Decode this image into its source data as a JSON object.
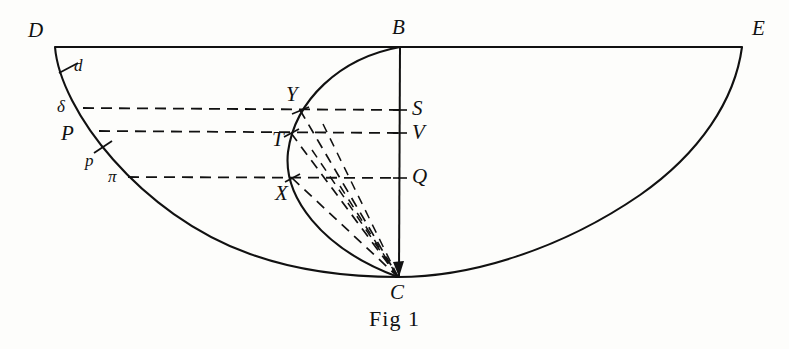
{
  "figure": {
    "caption": "Fig 1",
    "background_color": "#fdfdfb",
    "ink_color": "#111111",
    "labels": {
      "D": "D",
      "d": "d",
      "delta": "δ",
      "P": "P",
      "p": "p",
      "pi": "π",
      "B": "B",
      "Y": "Y",
      "T": "T",
      "X": "X",
      "S": "S",
      "V": "V",
      "Q": "Q",
      "C": "C",
      "E": "E"
    },
    "points": [
      {
        "name": "D",
        "label": "D",
        "x": 55,
        "y": 47,
        "label_x": 28,
        "label_y": 20,
        "style": "cap"
      },
      {
        "name": "d",
        "label": "d",
        "x": 68,
        "y": 68,
        "label_x": 74,
        "label_y": 57,
        "style": "small"
      },
      {
        "name": "delta",
        "label": "δ",
        "x": 82,
        "y": 108,
        "label_x": 57,
        "label_y": 98,
        "style": "greek"
      },
      {
        "name": "P",
        "label": "P",
        "x": 97,
        "y": 133,
        "label_x": 61,
        "label_y": 123,
        "style": "cap"
      },
      {
        "name": "p",
        "label": "p",
        "x": 103,
        "y": 147,
        "label_x": 85,
        "label_y": 152,
        "style": "small"
      },
      {
        "name": "pi",
        "label": "π",
        "x": 127,
        "y": 178,
        "label_x": 108,
        "label_y": 168,
        "style": "greek"
      },
      {
        "name": "B",
        "label": "B",
        "x": 400,
        "y": 47,
        "label_x": 392,
        "label_y": 17,
        "style": "cap"
      },
      {
        "name": "Y",
        "label": "Y",
        "x": 300,
        "y": 110,
        "label_x": 286,
        "label_y": 84,
        "style": "cap"
      },
      {
        "name": "T",
        "label": "T",
        "x": 291,
        "y": 133,
        "label_x": 272,
        "label_y": 129,
        "style": "cap"
      },
      {
        "name": "X",
        "label": "X",
        "x": 292,
        "y": 178,
        "label_x": 275,
        "label_y": 183,
        "style": "cap"
      },
      {
        "name": "S",
        "label": "S",
        "x": 400,
        "y": 110,
        "label_x": 412,
        "label_y": 98,
        "style": "cap"
      },
      {
        "name": "V",
        "label": "V",
        "x": 400,
        "y": 133,
        "label_x": 412,
        "label_y": 122,
        "style": "cap"
      },
      {
        "name": "Q",
        "label": "Q",
        "x": 400,
        "y": 178,
        "label_x": 412,
        "label_y": 166,
        "style": "cap"
      },
      {
        "name": "C",
        "label": "C",
        "x": 398,
        "y": 277,
        "label_x": 390,
        "label_y": 282,
        "style": "cap"
      },
      {
        "name": "E",
        "label": "E",
        "x": 742,
        "y": 47,
        "label_x": 752,
        "label_y": 18,
        "style": "cap"
      }
    ],
    "dashed_chords": [
      {
        "name": "chord-delta-Y-S",
        "from": "delta",
        "to": "S",
        "y": 108
      },
      {
        "name": "chord-P-T-V",
        "from": "P",
        "to": "V",
        "y": 133
      },
      {
        "name": "chord-pi-X-Q",
        "from": "pi",
        "to": "Q",
        "y": 178
      }
    ],
    "dashed_rays_to_C": [
      {
        "name": "ray-Y-to-C",
        "from": "Y"
      },
      {
        "name": "ray-T-to-C",
        "from": "T"
      },
      {
        "name": "ray-X-to-C",
        "from": "X"
      },
      {
        "name": "ray-S-to-C",
        "from": "S"
      },
      {
        "name": "ray-V-to-C",
        "from": "V"
      },
      {
        "name": "ray-Q-to-C",
        "from": "Q"
      }
    ],
    "solid_lines": [
      {
        "name": "baseline-DBE",
        "from": "D",
        "to": "E"
      },
      {
        "name": "axis-BC",
        "from": "B",
        "to": "C"
      }
    ],
    "curves": [
      {
        "name": "outer-curve-DCE",
        "through": [
          "D",
          "C",
          "E"
        ]
      },
      {
        "name": "inner-arc-BC",
        "through": [
          "B",
          "C"
        ]
      }
    ],
    "tick_marks": [
      {
        "name": "tick-d",
        "at": "d"
      },
      {
        "name": "tick-p",
        "at": "p"
      }
    ]
  }
}
